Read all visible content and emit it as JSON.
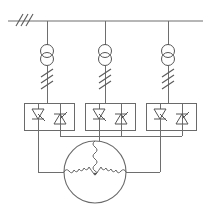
{
  "diagram": {
    "title": "Three-phase thyristor soft-starter motor circuit",
    "type": "electrical-schematic",
    "colors": {
      "line": "#6e6e6e",
      "symbol": "#555555",
      "background": "#ffffff"
    },
    "canvas": {
      "width": 211,
      "height": 208
    },
    "supply": {
      "name": "three-phase-busbar",
      "label": "",
      "bus_y": 21,
      "bus_x_start": 8,
      "bus_x_end": 203,
      "earth_hatch": {
        "name": "earth-hatch-marks",
        "count": 3,
        "x": 18,
        "y": 21
      }
    },
    "phases": [
      {
        "id": "L1",
        "label": "",
        "x": 47
      },
      {
        "id": "L2",
        "label": "",
        "x": 105
      },
      {
        "id": "L3",
        "label": "",
        "x": 168
      }
    ],
    "transformers": [
      {
        "name": "current-transformer-l1",
        "label": "",
        "cx": 47,
        "cy": 55
      },
      {
        "name": "current-transformer-l2",
        "label": "",
        "cx": 105,
        "cy": 55
      },
      {
        "name": "current-transformer-l3",
        "label": "",
        "cx": 168,
        "cy": 55
      }
    ],
    "reactors": [
      {
        "name": "line-reactor-l1",
        "label": "",
        "x": 47,
        "y_top": 68,
        "y_bottom": 92,
        "slash_count": 3
      },
      {
        "name": "line-reactor-l2",
        "label": "",
        "x": 105,
        "y_top": 68,
        "y_bottom": 92,
        "slash_count": 3
      },
      {
        "name": "line-reactor-l3",
        "label": "",
        "x": 168,
        "y_top": 68,
        "y_bottom": 92,
        "slash_count": 3
      }
    ],
    "thyristor_modules": [
      {
        "name": "thyristor-module-l1",
        "label": "",
        "box": {
          "x": 24,
          "y": 103,
          "w": 50,
          "h": 27
        },
        "scr_forward": {
          "name": "scr-forward-l1",
          "cx": 38,
          "cy": 116
        },
        "scr_reverse": {
          "name": "scr-reverse-l1",
          "cx": 60,
          "cy": 116
        }
      },
      {
        "name": "thyristor-module-l2",
        "label": "",
        "box": {
          "x": 85,
          "y": 103,
          "w": 50,
          "h": 27
        },
        "scr_forward": {
          "name": "scr-forward-l2",
          "cx": 99,
          "cy": 116
        },
        "scr_reverse": {
          "name": "scr-reverse-l2",
          "cx": 121,
          "cy": 116
        }
      },
      {
        "name": "thyristor-module-l3",
        "label": "",
        "box": {
          "x": 146,
          "y": 103,
          "w": 50,
          "h": 27
        },
        "scr_forward": {
          "name": "scr-forward-l3",
          "cx": 160,
          "cy": 116
        },
        "scr_reverse": {
          "name": "scr-reverse-l3",
          "cx": 182,
          "cy": 116
        }
      }
    ],
    "machine": {
      "name": "three-phase-motor",
      "label": "",
      "winding": "wye",
      "cx": 95,
      "cy": 172,
      "r": 31
    }
  }
}
